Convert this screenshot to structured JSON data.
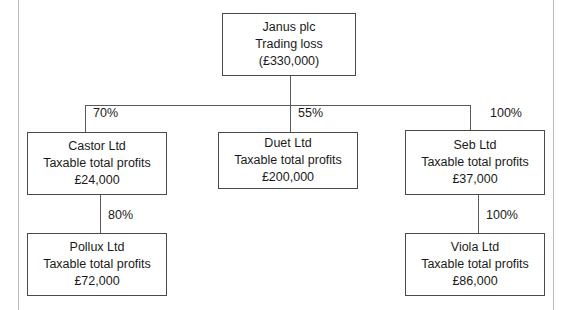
{
  "diagram": {
    "type": "organisation-group-structure",
    "nodes": {
      "janus": {
        "name": "Janus plc",
        "caption": "Trading loss",
        "amount": "(£330,000)"
      },
      "castor": {
        "name": "Castor Ltd",
        "caption": "Taxable total profits",
        "amount": "£24,000"
      },
      "duet": {
        "name": "Duet Ltd",
        "caption": "Taxable total profits",
        "amount": "£200,000"
      },
      "seb": {
        "name": "Seb Ltd",
        "caption": "Taxable total profits",
        "amount": "£37,000"
      },
      "pollux": {
        "name": "Pollux Ltd",
        "caption": "Taxable total profits",
        "amount": "£72,000"
      },
      "viola": {
        "name": "Viola Ltd",
        "caption": "Taxable total profits",
        "amount": "£86,000"
      }
    },
    "edges": {
      "janus_castor": "70%",
      "janus_duet": "55%",
      "janus_seb": "100%",
      "castor_pollux": "80%",
      "seb_viola": "100%"
    }
  }
}
